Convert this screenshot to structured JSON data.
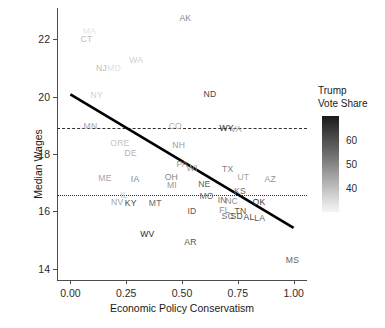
{
  "chart_data": {
    "type": "scatter",
    "title": "",
    "xlabel": "Economic Policy Conservatism",
    "ylabel": "Median Wages",
    "xlim": [
      -0.06,
      1.06
    ],
    "ylim": [
      13.6,
      23.1
    ],
    "xticks": [
      "0.00",
      "0.25",
      "0.50",
      "0.75",
      "1.00"
    ],
    "xtick_values": [
      0.0,
      0.25,
      0.5,
      0.75,
      1.0
    ],
    "yticks": [
      "14",
      "16",
      "18",
      "20",
      "22"
    ],
    "ytick_values": [
      14,
      16,
      18,
      20,
      22
    ],
    "grid": false,
    "point_label_field": "state",
    "color_field": "trump_vote_share",
    "points": [
      {
        "state": "AK",
        "x": 0.515,
        "y": 22.75,
        "trump_vote_share": 51
      },
      {
        "state": "MA",
        "x": 0.085,
        "y": 22.3,
        "trump_vote_share": 33
      },
      {
        "state": "CT",
        "x": 0.072,
        "y": 22.0,
        "trump_vote_share": 41
      },
      {
        "state": "WA",
        "x": 0.295,
        "y": 21.27,
        "trump_vote_share": 37
      },
      {
        "state": "MD",
        "x": 0.195,
        "y": 21.02,
        "trump_vote_share": 34
      },
      {
        "state": "NJ",
        "x": 0.139,
        "y": 21.0,
        "trump_vote_share": 41
      },
      {
        "state": "ND",
        "x": 0.625,
        "y": 20.1,
        "trump_vote_share": 63
      },
      {
        "state": "NY",
        "x": 0.118,
        "y": 20.07,
        "trump_vote_share": 37
      },
      {
        "state": "HI",
        "x": 0.03,
        "y": 19.0,
        "trump_vote_share": 30
      },
      {
        "state": "MN",
        "x": 0.09,
        "y": 18.98,
        "trump_vote_share": 45
      },
      {
        "state": "CO",
        "x": 0.47,
        "y": 18.98,
        "trump_vote_share": 43
      },
      {
        "state": "WY",
        "x": 0.7,
        "y": 18.92,
        "trump_vote_share": 68
      },
      {
        "state": "VA",
        "x": 0.742,
        "y": 18.86,
        "trump_vote_share": 45
      },
      {
        "state": "ORE",
        "x": 0.222,
        "y": 18.37,
        "trump_vote_share": 39
      },
      {
        "state": "NH",
        "x": 0.485,
        "y": 18.32,
        "trump_vote_share": 47
      },
      {
        "state": "DE",
        "x": 0.27,
        "y": 18.05,
        "trump_vote_share": 42
      },
      {
        "state": "PA",
        "x": 0.5,
        "y": 17.64,
        "trump_vote_share": 48
      },
      {
        "state": "WI",
        "x": 0.545,
        "y": 17.52,
        "trump_vote_share": 47
      },
      {
        "state": "TX",
        "x": 0.705,
        "y": 17.48,
        "trump_vote_share": 52
      },
      {
        "state": "ME",
        "x": 0.155,
        "y": 17.16,
        "trump_vote_share": 45
      },
      {
        "state": "IA",
        "x": 0.29,
        "y": 17.13,
        "trump_vote_share": 51
      },
      {
        "state": "OH",
        "x": 0.452,
        "y": 17.18,
        "trump_vote_share": 51
      },
      {
        "state": "UT",
        "x": 0.775,
        "y": 17.2,
        "trump_vote_share": 45
      },
      {
        "state": "AZ",
        "x": 0.895,
        "y": 17.13,
        "trump_vote_share": 48
      },
      {
        "state": "MI",
        "x": 0.455,
        "y": 16.93,
        "trump_vote_share": 47
      },
      {
        "state": "NE",
        "x": 0.6,
        "y": 16.96,
        "trump_vote_share": 58
      },
      {
        "state": "KS",
        "x": 0.76,
        "y": 16.72,
        "trump_vote_share": 56
      },
      {
        "state": "IL",
        "x": 0.24,
        "y": 16.58,
        "trump_vote_share": 38
      },
      {
        "state": "MO",
        "x": 0.61,
        "y": 16.55,
        "trump_vote_share": 56
      },
      {
        "state": "IN",
        "x": 0.68,
        "y": 16.38,
        "trump_vote_share": 56
      },
      {
        "state": "NC",
        "x": 0.722,
        "y": 16.36,
        "trump_vote_share": 49
      },
      {
        "state": "NV",
        "x": 0.21,
        "y": 16.33,
        "trump_vote_share": 45
      },
      {
        "state": "KY",
        "x": 0.27,
        "y": 16.3,
        "trump_vote_share": 62
      },
      {
        "state": "MT",
        "x": 0.38,
        "y": 16.3,
        "trump_vote_share": 56
      },
      {
        "state": "OK",
        "x": 0.845,
        "y": 16.34,
        "trump_vote_share": 65
      },
      {
        "state": "ID",
        "x": 0.545,
        "y": 16.02,
        "trump_vote_share": 59
      },
      {
        "state": "FL",
        "x": 0.69,
        "y": 16.04,
        "trump_vote_share": 49
      },
      {
        "state": "TN",
        "x": 0.762,
        "y": 16.0,
        "trump_vote_share": 60
      },
      {
        "state": "SC",
        "x": 0.705,
        "y": 15.82,
        "trump_vote_share": 55
      },
      {
        "state": "SD",
        "x": 0.745,
        "y": 15.82,
        "trump_vote_share": 61
      },
      {
        "state": "AL",
        "x": 0.8,
        "y": 15.8,
        "trump_vote_share": 62
      },
      {
        "state": "LA",
        "x": 0.848,
        "y": 15.78,
        "trump_vote_share": 58
      },
      {
        "state": "WV",
        "x": 0.345,
        "y": 15.22,
        "trump_vote_share": 68
      },
      {
        "state": "AR",
        "x": 0.538,
        "y": 14.94,
        "trump_vote_share": 60
      },
      {
        "state": "MS",
        "x": 0.995,
        "y": 14.3,
        "trump_vote_share": 57
      }
    ],
    "fit_line": {
      "type": "linear-regression",
      "x_start": 0.0,
      "y_start": 20.08,
      "x_end": 1.0,
      "y_end": 15.42,
      "color": "#000000"
    },
    "reference_lines": [
      {
        "name": "dashed-mean-line",
        "orientation": "horizontal",
        "y": 18.9,
        "style": "dashed"
      },
      {
        "name": "dotted-median-line",
        "orientation": "horizontal",
        "y": 16.56,
        "style": "dotted"
      }
    ]
  },
  "legend": {
    "title_line1": "Trump",
    "title_line2": "Vote Share",
    "ticks": [
      {
        "label": "60",
        "value": 60
      },
      {
        "label": "50",
        "value": 50
      },
      {
        "label": "40",
        "value": 40
      }
    ],
    "scale_min": 30,
    "scale_max": 70,
    "gradient_dark": "#1a1a1a",
    "gradient_light": "#f4f4f4",
    "position": "right"
  }
}
